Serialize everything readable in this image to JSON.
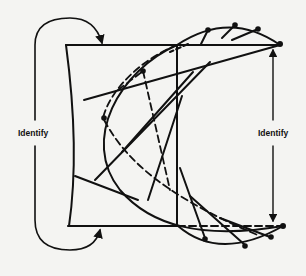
{
  "figure": {
    "labels": {
      "left": "Identify",
      "right": "Identify"
    },
    "colors": {
      "ink": "#111111",
      "paper": "#f4f4f2"
    },
    "top_arc_dots": 4,
    "bottom_arc_dots": 4,
    "interior_dots": 2
  }
}
